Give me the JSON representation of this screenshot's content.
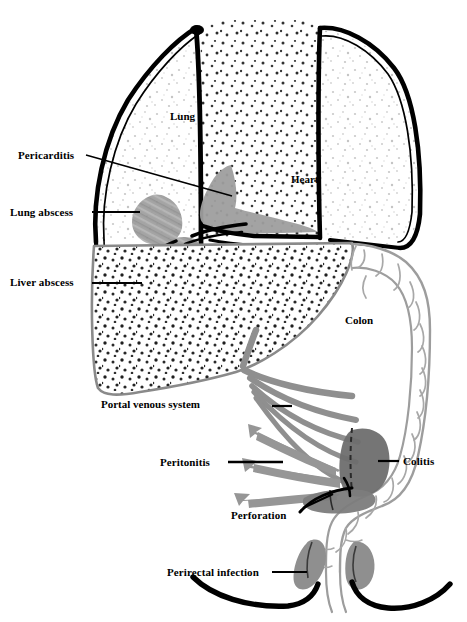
{
  "figure": {
    "type": "anatomical-diagram",
    "background_color": "#ffffff",
    "ink_color": "#000000",
    "lesion_color": "#9a9a9a",
    "organ_outline_color": "#8c8c8c"
  },
  "organ_labels": [
    {
      "id": "lung",
      "text": "Lung",
      "x": 170,
      "y": 117
    },
    {
      "id": "heart",
      "text": "Heart",
      "x": 291,
      "y": 180
    },
    {
      "id": "colon",
      "text": "Colon",
      "x": 345,
      "y": 321
    },
    {
      "id": "portal-venous-system",
      "text": "Portal venous system",
      "x": 101,
      "y": 404
    }
  ],
  "callouts": [
    {
      "id": "pericarditis",
      "text": "Pericarditis",
      "side": "left",
      "label_x": 18,
      "label_y": 149,
      "leader": {
        "x1": 86,
        "y1": 155,
        "x2": 232,
        "y2": 196
      }
    },
    {
      "id": "lung-abscess",
      "text": "Lung abscess",
      "side": "left",
      "label_x": 10,
      "label_y": 206,
      "leader": {
        "x1": 92,
        "y1": 212,
        "x2": 140,
        "y2": 212
      }
    },
    {
      "id": "liver-abscess",
      "text": "Liver abscess",
      "side": "left",
      "label_x": 10,
      "label_y": 276,
      "leader": {
        "x1": 92,
        "y1": 283,
        "x2": 142,
        "y2": 283
      }
    },
    {
      "id": "peritonitis",
      "text": "Peritonitis",
      "side": "left",
      "label_x": 160,
      "label_y": 456,
      "leader": {
        "x1": 228,
        "y1": 462,
        "x2": 283,
        "y2": 462
      }
    },
    {
      "id": "perforation",
      "text": "Perforation",
      "side": "left",
      "label_x": 231,
      "label_y": 509,
      "leader": {
        "x1": 303,
        "y1": 508,
        "x2": 333,
        "y2": 494
      }
    },
    {
      "id": "colitis",
      "text": "Colitis",
      "side": "right",
      "label_x": 403,
      "label_y": 455,
      "leader": {
        "x1": 378,
        "y1": 461,
        "x2": 399,
        "y2": 461
      }
    },
    {
      "id": "perirectal-infection",
      "text": "Perirectal infection",
      "side": "left",
      "label_x": 167,
      "label_y": 566,
      "leader": {
        "x1": 272,
        "y1": 572,
        "x2": 307,
        "y2": 572
      }
    }
  ],
  "lesions": [
    {
      "id": "lung-abscess-mass",
      "label": "lung abscess"
    },
    {
      "id": "liver-abscess-mass",
      "label": "liver abscess"
    },
    {
      "id": "pericardium-mass",
      "label": "pericarditis"
    },
    {
      "id": "colitis-mass",
      "label": "colitis"
    },
    {
      "id": "perforation-mass",
      "label": "perforation"
    },
    {
      "id": "perirectal-mass-left",
      "label": "perirectal infection left"
    },
    {
      "id": "perirectal-mass-right",
      "label": "perirectal infection right"
    }
  ],
  "spread_arrows": {
    "count": 3,
    "direction": "leftward",
    "meaning": "peritonitis"
  },
  "portal_vessels": {
    "count": 5,
    "meaning": "portal venous spread from colon to liver"
  }
}
